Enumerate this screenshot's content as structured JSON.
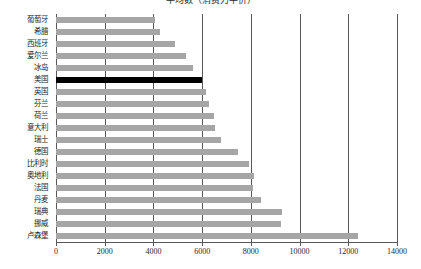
{
  "chart_data": {
    "type": "bar",
    "orientation": "horizontal",
    "title": "平均数（消费力平价）",
    "xlabel": "",
    "ylabel": "",
    "xlim": [
      0,
      14000
    ],
    "xticks": [
      0,
      2000,
      4000,
      6000,
      8000,
      10000,
      12000,
      14000
    ],
    "xtick_labels": [
      "0",
      "2000",
      "4000",
      "6000",
      "8000",
      "10000",
      "12000",
      "14000"
    ],
    "grid": true,
    "grid_axis": "x",
    "legend": null,
    "bar_color": "#a6a6a6",
    "highlight_color": "#000000",
    "highlighted_category": "美国",
    "categories": [
      "葡萄牙",
      "希腊",
      "西班牙",
      "爱尔兰",
      "冰岛",
      "美国",
      "英国",
      "芬兰",
      "荷兰",
      "意大利",
      "瑞士",
      "德国",
      "比利时",
      "奥地利",
      "法国",
      "丹麦",
      "瑞典",
      "挪威",
      "卢森堡"
    ],
    "values": [
      4050,
      4270,
      4880,
      5320,
      5620,
      6000,
      6170,
      6280,
      6500,
      6540,
      6770,
      7490,
      7940,
      8110,
      8100,
      8420,
      9270,
      9230,
      12400
    ],
    "bars": [
      {
        "category": "葡萄牙",
        "value": 4050,
        "color": "#a6a6a6",
        "highlight": false
      },
      {
        "category": "希腊",
        "value": 4270,
        "color": "#a6a6a6",
        "highlight": false
      },
      {
        "category": "西班牙",
        "value": 4880,
        "color": "#a6a6a6",
        "highlight": false
      },
      {
        "category": "爱尔兰",
        "value": 5320,
        "color": "#a6a6a6",
        "highlight": false
      },
      {
        "category": "冰岛",
        "value": 5620,
        "color": "#a6a6a6",
        "highlight": false
      },
      {
        "category": "美国",
        "value": 6000,
        "color": "#000000",
        "highlight": true
      },
      {
        "category": "英国",
        "value": 6170,
        "color": "#a6a6a6",
        "highlight": false
      },
      {
        "category": "芬兰",
        "value": 6280,
        "color": "#a6a6a6",
        "highlight": false
      },
      {
        "category": "荷兰",
        "value": 6500,
        "color": "#a6a6a6",
        "highlight": false
      },
      {
        "category": "意大利",
        "value": 6540,
        "color": "#a6a6a6",
        "highlight": false
      },
      {
        "category": "瑞士",
        "value": 6770,
        "color": "#a6a6a6",
        "highlight": false
      },
      {
        "category": "德国",
        "value": 7490,
        "color": "#a6a6a6",
        "highlight": false
      },
      {
        "category": "比利时",
        "value": 7940,
        "color": "#a6a6a6",
        "highlight": false
      },
      {
        "category": "奥地利",
        "value": 8110,
        "color": "#a6a6a6",
        "highlight": false
      },
      {
        "category": "法国",
        "value": 8100,
        "color": "#a6a6a6",
        "highlight": false
      },
      {
        "category": "丹麦",
        "value": 8420,
        "color": "#a6a6a6",
        "highlight": false
      },
      {
        "category": "瑞典",
        "value": 9270,
        "color": "#a6a6a6",
        "highlight": false
      },
      {
        "category": "挪威",
        "value": 9230,
        "color": "#a6a6a6",
        "highlight": false
      },
      {
        "category": "卢森堡",
        "value": 12400,
        "color": "#a6a6a6",
        "highlight": false
      }
    ]
  }
}
